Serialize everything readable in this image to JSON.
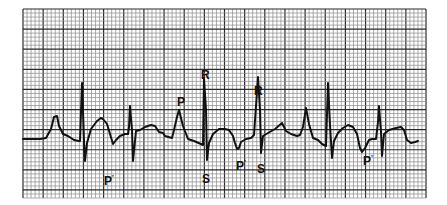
{
  "figure": {
    "type": "ECG rhythm strip",
    "grid": {
      "left": 23,
      "top": 9,
      "right": 426,
      "bottom": 198,
      "minor_spacing": 4.03,
      "major_every": 5,
      "minor_color": "#8a8a8a",
      "major_color": "#2a2a2a"
    },
    "trace_color": "#111111",
    "labels": [
      {
        "id": "p-prime-1",
        "text": "P",
        "prime": "'",
        "x": 104,
        "y": 175
      },
      {
        "id": "p-1",
        "text": "P",
        "x": 177,
        "y": 96
      },
      {
        "id": "r-1",
        "text": "R",
        "x": 201,
        "y": 69
      },
      {
        "id": "s-1",
        "text": "S",
        "x": 202,
        "y": 173
      },
      {
        "id": "p-prime-2",
        "text": "P",
        "prime": "'",
        "x": 236,
        "y": 160
      },
      {
        "id": "r-2",
        "text": "R",
        "x": 254,
        "y": 85
      },
      {
        "id": "s-2",
        "text": "S",
        "x": 257,
        "y": 163
      },
      {
        "id": "p-prime-3",
        "text": "P",
        "prime": "'",
        "x": 363,
        "y": 155
      }
    ]
  }
}
